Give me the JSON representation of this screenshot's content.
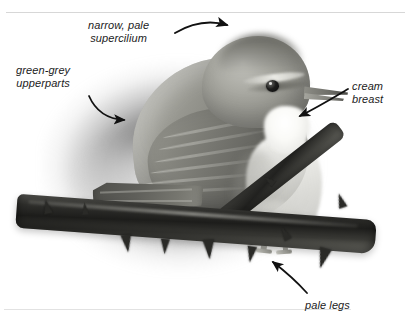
{
  "page": {
    "type": "field-guide-annotated-photograph",
    "cropped_header_text": "",
    "rules": {
      "top": true,
      "bottom": true
    }
  },
  "photo": {
    "subject": "warbler perched on thorny bramble branch",
    "style": "black-and-white photograph with soft dark vignette",
    "bird": {
      "crown": "plain grey-green crown",
      "eye": "dark rounded eye",
      "bill": "fine pointed bill",
      "supercilium": "narrow pale supercilium",
      "wing": "folded wing with feather tracts",
      "tail": "long tail to lower left",
      "underparts": "cream-white throat and breast",
      "legs": "pale legs gripping branch"
    },
    "branch": "dark thorny bramble stem with upward and downward thorns"
  },
  "annotations": [
    {
      "id": "supercilium",
      "label": "narrow, pale\nsupercilium",
      "arrow": "curved-arrow-right",
      "points_to": "bird-head-supercilium"
    },
    {
      "id": "upperparts",
      "label": "green-grey\nupperparts",
      "arrow": "curved-arrow-down-right",
      "points_to": "bird-back-wing"
    },
    {
      "id": "breast",
      "label": "cream\nbreast",
      "arrow": "straight-arrow-down-left",
      "points_to": "bird-breast"
    },
    {
      "id": "legs",
      "label": "pale legs",
      "arrow": "straight-arrow-up-left",
      "points_to": "bird-legs"
    }
  ],
  "colors": {
    "text": "#1b1b1b",
    "rule": "#d7d7d7",
    "background": "#ffffff",
    "arrow": "#111111"
  }
}
